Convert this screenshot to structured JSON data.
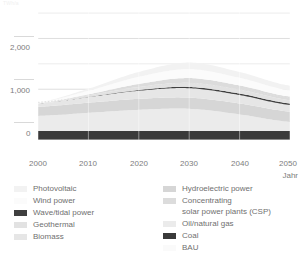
{
  "axis": {
    "unit_label": "TWh/a",
    "x_title": "Jahr",
    "y_ticks": [
      "2,000",
      "1,000",
      "0"
    ],
    "x_ticks": [
      "2000",
      "2010",
      "2020",
      "2030",
      "2040",
      "2050"
    ]
  },
  "legend": {
    "left": [
      {
        "label": "Photovoltaic",
        "color": "#f2f2f2"
      },
      {
        "label": "Wind power",
        "color": "#fbfbfb"
      },
      {
        "label": "Wave/tidal power",
        "color": "#3f3f3f"
      },
      {
        "label": "Geothermal",
        "color": "#e2e2e2"
      },
      {
        "label": "Biomass",
        "color": "#e6e6e6"
      }
    ],
    "right": [
      {
        "label": "Hydroelectric power",
        "color": "#d6d6d6"
      },
      {
        "label": "Concentrating\nsolar power plants (CSP)",
        "color": "#dcdcdc"
      },
      {
        "label": "Oil/natural gas",
        "color": "#ebebeb"
      },
      {
        "label": "Coal",
        "color": "#3a3a3a"
      },
      {
        "label": "BAU",
        "color": "#fafafa"
      }
    ]
  },
  "chart_data": {
    "type": "area",
    "stacked": true,
    "title": "",
    "xlabel": "Jahr",
    "ylabel": "TWh/a",
    "xlim": [
      2000,
      2050
    ],
    "ylim": [
      0,
      2600
    ],
    "grid": true,
    "legend_position": "bottom",
    "x": [
      2000,
      2010,
      2020,
      2030,
      2040,
      2050
    ],
    "series": [
      {
        "name": "Coal",
        "color": "#3a3a3a",
        "values": [
          175,
          175,
          175,
          175,
          175,
          175
        ]
      },
      {
        "name": "Oil/natural gas",
        "color": "#ebebeb",
        "values": [
          300,
          360,
          420,
          440,
          330,
          180
        ]
      },
      {
        "name": "Hydroelectric power",
        "color": "#d6d6d6",
        "values": [
          180,
          200,
          215,
          220,
          215,
          205
        ]
      },
      {
        "name": "Biomass",
        "color": "#e6e6e6",
        "values": [
          60,
          110,
          160,
          185,
          165,
          130
        ]
      },
      {
        "name": "Wave/tidal power",
        "color": "#3f3f3f",
        "values": [
          0,
          5,
          15,
          25,
          30,
          30
        ]
      },
      {
        "name": "Geothermal",
        "color": "#e2e2e2",
        "values": [
          10,
          30,
          60,
          80,
          75,
          65
        ]
      },
      {
        "name": "Concentrating solar power plants (CSP)",
        "color": "#dcdcdc",
        "values": [
          0,
          20,
          60,
          95,
          85,
          70
        ]
      },
      {
        "name": "Wind power",
        "color": "#fbfbfb",
        "values": [
          10,
          70,
          140,
          175,
          150,
          120
        ]
      },
      {
        "name": "Photovoltaic",
        "color": "#f2f2f2",
        "values": [
          5,
          40,
          95,
          130,
          115,
          95
        ]
      }
    ],
    "bau_line": {
      "name": "BAU",
      "color": "#e0e0e0",
      "style": "dotted",
      "values": [
        740,
        860,
        1020,
        1120,
        1000,
        840
      ]
    }
  }
}
